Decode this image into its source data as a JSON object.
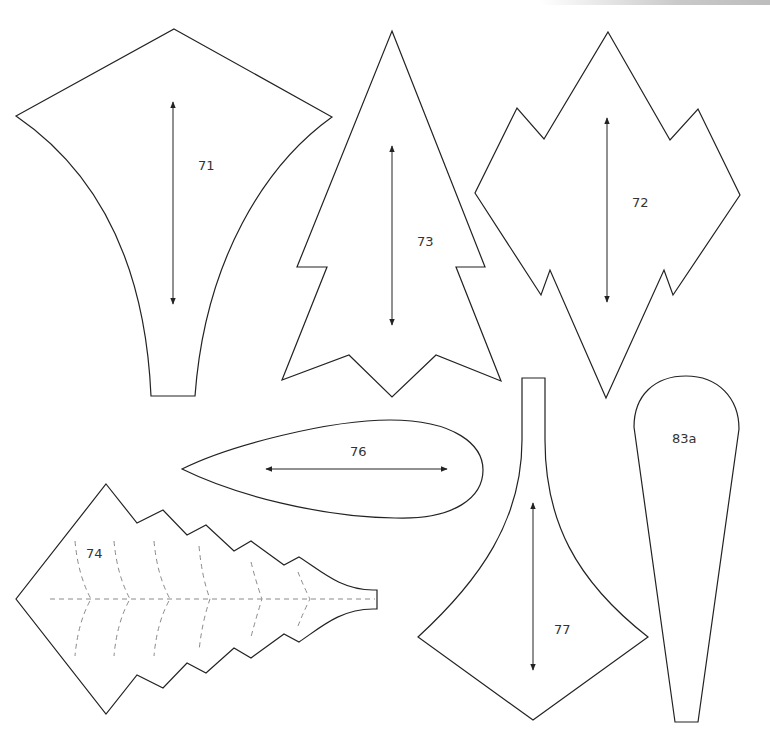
{
  "page": {
    "background": "#ffffff",
    "stroke_color": "#222222",
    "fold_line_color": "#8a8a8a"
  },
  "pieces": [
    {
      "id": "71",
      "label": "71",
      "shape": "kite-petal-with-stem",
      "grain_arrow": "vertical-double"
    },
    {
      "id": "73",
      "label": "73",
      "shape": "tall-pointed-leaf",
      "grain_arrow": "vertical-double"
    },
    {
      "id": "72",
      "label": "72",
      "shape": "jagged-diamond-leaf",
      "grain_arrow": "vertical-double"
    },
    {
      "id": "76",
      "label": "76",
      "shape": "teardrop-leaf-horizontal",
      "grain_arrow": "horizontal-double"
    },
    {
      "id": "74",
      "label": "74",
      "shape": "serrated-leaf-with-fold-lines",
      "grain_arrow": "none",
      "fold_lines": "dashed-vein"
    },
    {
      "id": "77",
      "label": "77",
      "shape": "stem-petal-inverted",
      "grain_arrow": "vertical-double"
    },
    {
      "id": "83a",
      "label": "83a",
      "shape": "long-teardrop-petal",
      "grain_arrow": "none"
    }
  ]
}
